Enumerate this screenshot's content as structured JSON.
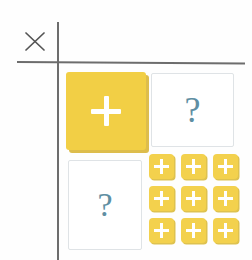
{
  "diagram": {
    "background_color": "#fefefe",
    "axis": {
      "line_color": "#6d6d6d",
      "vertical_label": "vertical-axis",
      "horizontal_label": "horizontal-axis"
    },
    "operator": {
      "symbol": "×",
      "name": "multiplication-sign",
      "color": "#555555"
    },
    "cells": {
      "top_left": {
        "name": "multiplicand-card",
        "type": "yellow-card",
        "glyph": "+",
        "glyph_name": "plus-icon",
        "fill_color": "#f2cf45",
        "shadow_color": "#ddbd4c",
        "glyph_color": "#ffffff"
      },
      "top_right": {
        "name": "multiplier-card",
        "type": "blank-card",
        "glyph": "?",
        "glyph_name": "question-mark",
        "fill_color": "#ffffff",
        "border_color": "#dfe3e6",
        "glyph_color": "#5f8fa3"
      },
      "bottom_left": {
        "name": "unknown-factor-card",
        "type": "blank-card",
        "glyph": "?",
        "glyph_name": "question-mark",
        "fill_color": "#ffffff",
        "border_color": "#dfe3e6",
        "glyph_color": "#5f8fa3"
      },
      "bottom_right": {
        "name": "product-tile-grid",
        "type": "tile-grid",
        "rows": 3,
        "columns": 3,
        "count": 9,
        "tile_glyph": "+",
        "tile_glyph_name": "plus-icon",
        "tile_fill_color": "#f3d14d",
        "tile_shadow_color": "#dec24f",
        "tile_glyph_color": "#ffffff",
        "tiles": [
          {
            "row": 1,
            "column": 1,
            "glyph": "+"
          },
          {
            "row": 1,
            "column": 2,
            "glyph": "+"
          },
          {
            "row": 1,
            "column": 3,
            "glyph": "+"
          },
          {
            "row": 2,
            "column": 1,
            "glyph": "+"
          },
          {
            "row": 2,
            "column": 2,
            "glyph": "+"
          },
          {
            "row": 2,
            "column": 3,
            "glyph": "+"
          },
          {
            "row": 3,
            "column": 1,
            "glyph": "+"
          },
          {
            "row": 3,
            "column": 2,
            "glyph": "+"
          },
          {
            "row": 3,
            "column": 3,
            "glyph": "+"
          }
        ]
      }
    }
  }
}
